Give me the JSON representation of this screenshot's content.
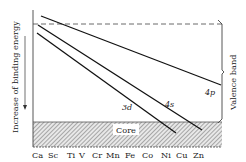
{
  "diagram": {
    "y_axis_label": "Increase of binding energy",
    "right_label": "Valence band",
    "core_label": "Core",
    "elements": [
      "Ca",
      "Sc",
      "Ti",
      "V",
      "Cr",
      "Mn",
      "Fe",
      "Co",
      "Ni",
      "Cu",
      "Zn"
    ],
    "lines": [
      {
        "id": "4p",
        "label": "4p"
      },
      {
        "id": "4s",
        "label": "4s"
      },
      {
        "id": "3d",
        "label": "3d"
      }
    ],
    "colors": {
      "ink": "#222222",
      "hatch_bg": "#e6e6e6"
    }
  }
}
